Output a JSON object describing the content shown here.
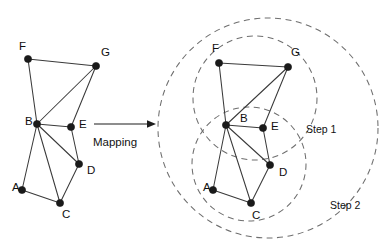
{
  "figure": {
    "title": "Graph mapping diagram with hierarchical clustering steps",
    "background_color": "#ffffff",
    "node_color": "#1a1a1a",
    "edge_color": "#3a3a3a",
    "region_color": "#6e6e6e"
  },
  "mapping": {
    "label": "Mapping",
    "arrow": "right-arrow"
  },
  "left_graph": {
    "name": "source-graph",
    "nodes": [
      {
        "id": "F",
        "label": "F",
        "x": 28,
        "y": 59,
        "label_x": 19,
        "label_y": 47
      },
      {
        "id": "G",
        "label": "G",
        "x": 96,
        "y": 66,
        "label_x": 101,
        "label_y": 53
      },
      {
        "id": "B",
        "label": "B",
        "x": 37,
        "y": 124,
        "label_x": 25,
        "label_y": 122
      },
      {
        "id": "E",
        "label": "E",
        "x": 71,
        "y": 127,
        "label_x": 79,
        "label_y": 125
      },
      {
        "id": "D",
        "label": "D",
        "x": 79,
        "y": 164,
        "label_x": 87,
        "label_y": 171
      },
      {
        "id": "A",
        "label": "A",
        "x": 22,
        "y": 190,
        "label_x": 12,
        "label_y": 188
      },
      {
        "id": "C",
        "label": "C",
        "x": 60,
        "y": 203,
        "label_x": 62,
        "label_y": 215
      }
    ],
    "edges": [
      [
        "F",
        "G"
      ],
      [
        "F",
        "B"
      ],
      [
        "G",
        "B"
      ],
      [
        "G",
        "E"
      ],
      [
        "B",
        "E"
      ],
      [
        "B",
        "D"
      ],
      [
        "B",
        "A"
      ],
      [
        "B",
        "C"
      ],
      [
        "E",
        "D"
      ],
      [
        "D",
        "C"
      ],
      [
        "A",
        "C"
      ]
    ]
  },
  "right_graph": {
    "name": "mapped-graph",
    "nodes": [
      {
        "id": "F",
        "label": "F",
        "x": 219,
        "y": 63,
        "label_x": 212,
        "label_y": 49
      },
      {
        "id": "G",
        "label": "G",
        "x": 288,
        "y": 67,
        "label_x": 291,
        "label_y": 53
      },
      {
        "id": "B",
        "label": "B",
        "x": 226,
        "y": 125,
        "label_x": 240,
        "label_y": 119
      },
      {
        "id": "E",
        "label": "E",
        "x": 263,
        "y": 128,
        "label_x": 271,
        "label_y": 127
      },
      {
        "id": "D",
        "label": "D",
        "x": 270,
        "y": 165,
        "label_x": 279,
        "label_y": 173
      },
      {
        "id": "A",
        "label": "A",
        "x": 213,
        "y": 190,
        "label_x": 203,
        "label_y": 188
      },
      {
        "id": "C",
        "label": "C",
        "x": 251,
        "y": 203,
        "label_x": 252,
        "label_y": 216
      }
    ],
    "edges": [
      [
        "F",
        "G"
      ],
      [
        "F",
        "B"
      ],
      [
        "G",
        "B"
      ],
      [
        "G",
        "E"
      ],
      [
        "B",
        "E"
      ],
      [
        "B",
        "D"
      ],
      [
        "B",
        "A"
      ],
      [
        "B",
        "C"
      ],
      [
        "E",
        "D"
      ],
      [
        "D",
        "C"
      ],
      [
        "A",
        "C"
      ]
    ]
  },
  "regions": [
    {
      "name": "cluster-upper",
      "label": "",
      "cx": 255,
      "cy": 98,
      "r": 62,
      "members": [
        "F",
        "G",
        "B",
        "E"
      ]
    },
    {
      "name": "cluster-lower",
      "label": "",
      "cx": 249,
      "cy": 164,
      "r": 57,
      "members": [
        "B",
        "E",
        "D",
        "A",
        "C"
      ]
    },
    {
      "name": "cluster-outer",
      "label": "",
      "cx": 268,
      "cy": 128,
      "r": 110,
      "members": [
        "F",
        "G",
        "B",
        "E",
        "D",
        "A",
        "C"
      ]
    }
  ],
  "annotations": [
    {
      "name": "step-1-label",
      "text": "Step 1",
      "x": 306,
      "y": 130
    },
    {
      "name": "step-2-label",
      "text": "Step 2",
      "x": 330,
      "y": 206
    }
  ]
}
